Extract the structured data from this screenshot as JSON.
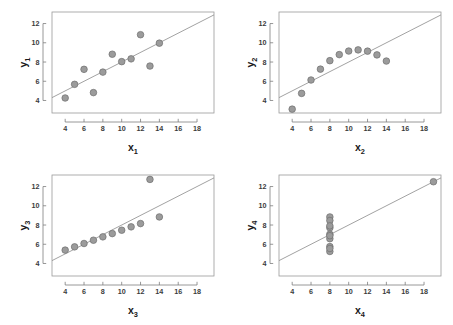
{
  "figure": {
    "background_color": "#ffffff",
    "marker_color": "#9b9b9b",
    "marker_edge_color": "#6f6f6f",
    "line_color": "#8a8a8a",
    "frame_color": "#9a9a9a",
    "text_color": "#1a1a1a"
  },
  "chart_data": [
    {
      "type": "scatter",
      "title": "",
      "xlabel": "x",
      "xlabel_sub": "1",
      "ylabel": "y",
      "ylabel_sub": "1",
      "xlim": [
        2.6,
        19.8
      ],
      "ylim": [
        2.7,
        13.2
      ],
      "xticks": [
        4,
        6,
        8,
        10,
        12,
        14,
        16,
        18
      ],
      "yticks": [
        4,
        6,
        8,
        10,
        12
      ],
      "grid": false,
      "legend": "none",
      "x": [
        10,
        8,
        13,
        9,
        11,
        14,
        6,
        4,
        12,
        7,
        5
      ],
      "y": [
        8.04,
        6.95,
        7.58,
        8.81,
        8.33,
        9.96,
        7.24,
        4.26,
        10.84,
        4.82,
        5.68
      ],
      "fit_line": {
        "intercept": 3.0,
        "slope": 0.5
      }
    },
    {
      "type": "scatter",
      "title": "",
      "xlabel": "x",
      "xlabel_sub": "2",
      "ylabel": "y",
      "ylabel_sub": "2",
      "xlim": [
        2.6,
        19.8
      ],
      "ylim": [
        2.7,
        13.2
      ],
      "xticks": [
        4,
        6,
        8,
        10,
        12,
        14,
        16,
        18
      ],
      "yticks": [
        4,
        6,
        8,
        10,
        12
      ],
      "grid": false,
      "legend": "none",
      "x": [
        10,
        8,
        13,
        9,
        11,
        14,
        6,
        4,
        12,
        7,
        5
      ],
      "y": [
        9.14,
        8.14,
        8.74,
        8.77,
        9.26,
        8.1,
        6.13,
        3.1,
        9.13,
        7.26,
        4.74
      ],
      "fit_line": {
        "intercept": 3.0,
        "slope": 0.5
      }
    },
    {
      "type": "scatter",
      "title": "",
      "xlabel": "x",
      "xlabel_sub": "3",
      "ylabel": "y",
      "ylabel_sub": "3",
      "xlim": [
        2.6,
        19.8
      ],
      "ylim": [
        2.7,
        13.2
      ],
      "xticks": [
        4,
        6,
        8,
        10,
        12,
        14,
        16,
        18
      ],
      "yticks": [
        4,
        6,
        8,
        10,
        12
      ],
      "grid": false,
      "legend": "none",
      "x": [
        10,
        8,
        13,
        9,
        11,
        14,
        6,
        4,
        12,
        7,
        5
      ],
      "y": [
        7.46,
        6.77,
        12.74,
        7.11,
        7.81,
        8.84,
        6.08,
        5.39,
        8.15,
        6.42,
        5.73
      ],
      "fit_line": {
        "intercept": 3.0,
        "slope": 0.5
      }
    },
    {
      "type": "scatter",
      "title": "",
      "xlabel": "x",
      "xlabel_sub": "4",
      "ylabel": "y",
      "ylabel_sub": "4",
      "xlim": [
        2.6,
        19.8
      ],
      "ylim": [
        2.7,
        13.2
      ],
      "xticks": [
        4,
        6,
        8,
        10,
        12,
        14,
        16,
        18
      ],
      "yticks": [
        4,
        6,
        8,
        10,
        12
      ],
      "grid": false,
      "legend": "none",
      "x": [
        8,
        8,
        8,
        8,
        8,
        8,
        8,
        19,
        8,
        8,
        8
      ],
      "y": [
        6.58,
        5.76,
        7.71,
        8.84,
        8.47,
        7.04,
        5.25,
        12.5,
        5.56,
        7.91,
        6.89
      ],
      "fit_line": {
        "intercept": 3.0,
        "slope": 0.5
      }
    }
  ]
}
